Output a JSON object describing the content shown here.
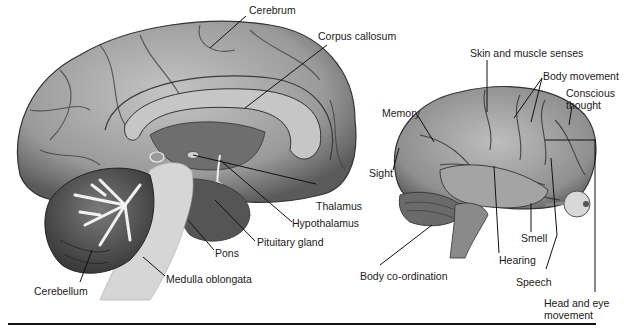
{
  "diagram": {
    "type": "anatomical-illustration",
    "colors": {
      "brain_light": "#b8b8b8",
      "brain_mid": "#8a8a8a",
      "brain_dark": "#4a4a4a",
      "stem": "#d6d6d6",
      "line": "#111111",
      "text": "#1a1a1a"
    },
    "views": [
      {
        "name": "sagittal-section",
        "labels": [
          {
            "id": "cerebrum",
            "text": "Cerebrum"
          },
          {
            "id": "corpus-callosum",
            "text": "Corpus callosum"
          },
          {
            "id": "thalamus",
            "text": "Thalamus"
          },
          {
            "id": "hypothalamus",
            "text": "Hypothalamus"
          },
          {
            "id": "pituitary-gland",
            "text": "Pituitary gland"
          },
          {
            "id": "pons",
            "text": "Pons"
          },
          {
            "id": "medulla-oblongata",
            "text": "Medulla oblongata"
          },
          {
            "id": "cerebellum",
            "text": "Cerebellum"
          }
        ]
      },
      {
        "name": "lateral-functional-areas",
        "labels": [
          {
            "id": "skin-muscle",
            "text": "Skin and muscle senses"
          },
          {
            "id": "body-movement",
            "text": "Body movement"
          },
          {
            "id": "conscious-thought",
            "text": "Conscious thought"
          },
          {
            "id": "memory",
            "text": "Memory"
          },
          {
            "id": "sight",
            "text": "Sight"
          },
          {
            "id": "body-coordination",
            "text": "Body co-ordination"
          },
          {
            "id": "hearing",
            "text": "Hearing"
          },
          {
            "id": "smell",
            "text": "Smell"
          },
          {
            "id": "speech",
            "text": "Speech"
          },
          {
            "id": "head-eye",
            "text": "Head and eye movement"
          }
        ]
      }
    ]
  }
}
